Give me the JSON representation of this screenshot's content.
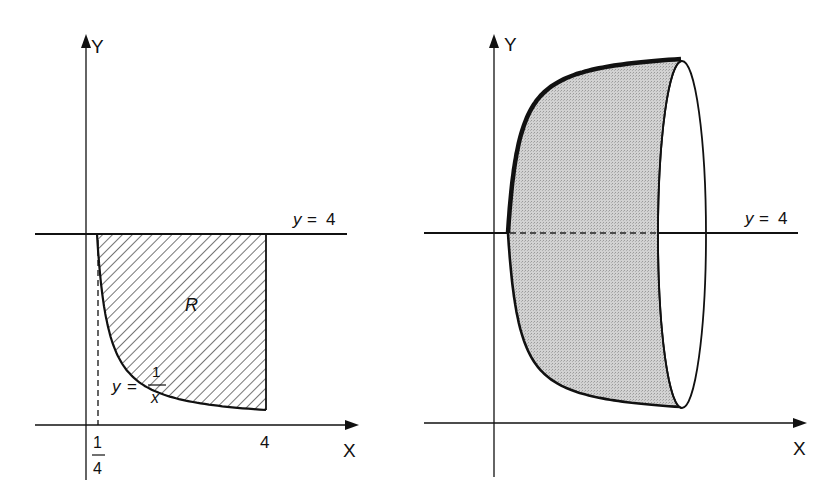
{
  "colors": {
    "ink": "#111111",
    "fill_gray": "#c9c9c9",
    "hatch": "#2a2a2a",
    "background": "#ffffff"
  },
  "left_figure": {
    "axis_labels": {
      "x": "X",
      "y": "Y"
    },
    "line_label": {
      "lhs": "y",
      "eq": "=",
      "rhs": "4"
    },
    "curve_label": {
      "lhs": "y",
      "eq": "=",
      "num": "1",
      "den": "x"
    },
    "region_label": "R",
    "tick_labels": {
      "quarter_num": "1",
      "quarter_den": "4",
      "four": "4"
    }
  },
  "right_figure": {
    "axis_labels": {
      "x": "X",
      "y": "Y"
    },
    "line_label": {
      "lhs": "y",
      "eq": "=",
      "rhs": "4"
    }
  },
  "chart_data": {
    "type": "diagram",
    "left": {
      "curve": "y = 1/x",
      "domain": [
        0.25,
        4
      ],
      "horizontal_line": "y = 4",
      "vertical_line": "x = 4",
      "dashed_line": "x = 1/4",
      "region": "R",
      "fill": "hatched"
    },
    "right": {
      "axis_of_revolution": "y = 4",
      "solid": "revolution of R about y = 4",
      "fill": "gray-shaded",
      "end_face": "ellipse at x = 4"
    }
  }
}
